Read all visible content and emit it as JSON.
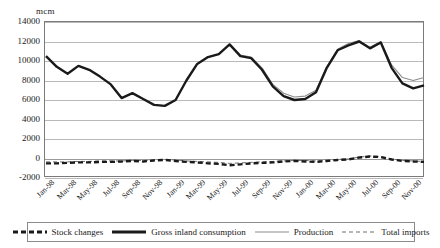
{
  "unit_label": "mcm",
  "axes": {
    "y_ticks": [
      "14000",
      "12000",
      "10000",
      "8000",
      "6000",
      "4000",
      "2000",
      "0",
      "-2000"
    ],
    "y_min": -2000,
    "y_max": 14000,
    "y_step": 2000,
    "x_ticks": [
      "Jan-98",
      "Mar-98",
      "May-98",
      "Jul-98",
      "Sep-98",
      "Nov-98",
      "Jan-99",
      "Mar-99",
      "May-99",
      "Jul-99",
      "Sep-99",
      "Nov-99",
      "Jan-00",
      "Mar-00",
      "May-00",
      "Jul-00",
      "Sep-00",
      "Nov-00"
    ]
  },
  "legend": {
    "items": [
      {
        "label": "Stock changes",
        "style": "thick-dashed",
        "color": "#1a1a1a"
      },
      {
        "label": "Gross inland consumption",
        "style": "thick-solid",
        "color": "#1a1a1a"
      },
      {
        "label": "Production",
        "style": "thin-solid",
        "color": "#8c8c8c"
      },
      {
        "label": "Total imports",
        "style": "thin-dashed",
        "color": "#6e6e6e"
      }
    ]
  },
  "chart_data": {
    "type": "line",
    "title": "",
    "xlabel": "",
    "ylabel": "mcm",
    "ylim": [
      -2000,
      14000
    ],
    "ytick_step": 2000,
    "grid": true,
    "legend_position": "bottom",
    "x": [
      "Jan-98",
      "Feb-98",
      "Mar-98",
      "Apr-98",
      "May-98",
      "Jun-98",
      "Jul-98",
      "Aug-98",
      "Sep-98",
      "Oct-98",
      "Nov-98",
      "Dec-98",
      "Jan-99",
      "Feb-99",
      "Mar-99",
      "Apr-99",
      "May-99",
      "Jun-99",
      "Jul-99",
      "Aug-99",
      "Sep-99",
      "Oct-99",
      "Nov-99",
      "Dec-99",
      "Jan-00",
      "Feb-00",
      "Mar-00",
      "Apr-00",
      "May-00",
      "Jun-00",
      "Jul-00",
      "Aug-00",
      "Sep-00",
      "Oct-00",
      "Nov-00",
      "Dec-00"
    ],
    "series": [
      {
        "name": "Gross inland consumption",
        "color": "#1a1a1a",
        "style": "thick-solid",
        "values": [
          10500,
          9400,
          8700,
          9500,
          9100,
          8400,
          7600,
          6200,
          6700,
          6100,
          5500,
          5400,
          6000,
          8000,
          9700,
          10400,
          10700,
          11700,
          10500,
          10300,
          9100,
          7400,
          6400,
          6000,
          6100,
          6800,
          9300,
          11100,
          11600,
          12000,
          11300,
          11900,
          9300,
          7700,
          7200,
          7500
        ]
      },
      {
        "name": "Production",
        "color": "#8c8c8c",
        "style": "thin-solid",
        "values": [
          10500,
          9400,
          8700,
          9500,
          9100,
          8400,
          7600,
          6200,
          6700,
          6100,
          5500,
          5400,
          6000,
          8000,
          9700,
          10400,
          10700,
          11700,
          10600,
          10400,
          9300,
          7600,
          6700,
          6300,
          6400,
          7000,
          9400,
          11200,
          11800,
          12100,
          11400,
          12000,
          9600,
          8300,
          8000,
          8300
        ]
      },
      {
        "name": "Stock changes",
        "color": "#1a1a1a",
        "style": "thick-dashed",
        "values": [
          -500,
          -500,
          -450,
          -400,
          -400,
          -350,
          -350,
          -300,
          -250,
          -300,
          -200,
          -150,
          -250,
          -350,
          -400,
          -500,
          -550,
          -700,
          -600,
          -500,
          -450,
          -400,
          -300,
          -250,
          -300,
          -350,
          -250,
          -150,
          -100,
          100,
          200,
          150,
          -100,
          -250,
          -300,
          -350
        ]
      },
      {
        "name": "Total imports",
        "color": "#6e6e6e",
        "style": "thin-dashed",
        "values": [
          -350,
          -350,
          -350,
          -300,
          -300,
          -250,
          -250,
          -250,
          -200,
          -200,
          -150,
          -100,
          -150,
          -250,
          -300,
          -350,
          -400,
          -500,
          -450,
          -400,
          -350,
          -300,
          -250,
          -200,
          -200,
          -250,
          -200,
          -100,
          -50,
          150,
          250,
          200,
          -50,
          -200,
          -250,
          -300
        ]
      }
    ]
  }
}
